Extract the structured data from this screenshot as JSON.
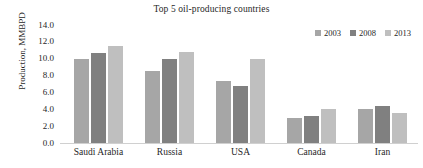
{
  "chart_data": {
    "type": "bar",
    "title": "Top 5 oil-producing countries",
    "xlabel": "",
    "ylabel": "Production, MMBPD",
    "categories": [
      "Saudi Arabia",
      "Russia",
      "USA",
      "Canada",
      "Iran"
    ],
    "series": [
      {
        "name": "2003",
        "color": "#a6a6a6",
        "values": [
          10.0,
          8.5,
          7.4,
          3.0,
          4.0
        ]
      },
      {
        "name": "2008",
        "color": "#808080",
        "values": [
          10.7,
          10.0,
          6.8,
          3.2,
          4.4
        ]
      },
      {
        "name": "2013",
        "color": "#bfbfbf",
        "values": [
          11.5,
          10.8,
          10.0,
          4.0,
          3.6
        ]
      }
    ],
    "ylim": [
      0.0,
      14.0
    ],
    "ytick_labels": [
      "14.0",
      "12.0",
      "10.0",
      "8.0",
      "6.0",
      "4.0",
      "2.0",
      "0.0"
    ],
    "ytick_values": [
      14.0,
      12.0,
      10.0,
      8.0,
      6.0,
      4.0,
      2.0,
      0.0
    ],
    "grid": false,
    "legend_position": "top-right"
  }
}
